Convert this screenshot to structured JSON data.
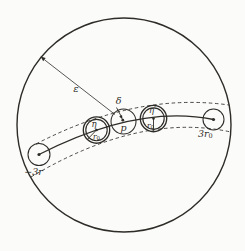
{
  "figure": {
    "type": "math-diagram",
    "colors": {
      "ink": "#2e2c28",
      "paper": "#fbfbf9"
    },
    "labels": {
      "epsilon": "ε",
      "delta": "δ",
      "eta": "η",
      "eta_prime": "η′",
      "p": "p",
      "r0_base": "r",
      "r0_sub": "0",
      "minus_three_r": "−3r",
      "three_r0_base": "3r",
      "three_r0_sub": "0"
    }
  }
}
